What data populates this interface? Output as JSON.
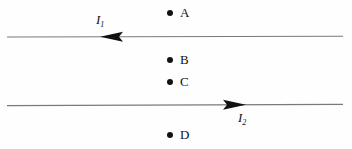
{
  "figure": {
    "background_color": "#fefefe",
    "ink_color": "#111111",
    "wire_color": "#7a7a7a"
  },
  "wires": [
    {
      "id": "wire-top",
      "current_label": "I",
      "current_subscript": "1",
      "direction": "left",
      "y": 37,
      "x_start": 7,
      "x_end": 343,
      "arrow_tip_x": 100
    },
    {
      "id": "wire-bottom",
      "current_label": "I",
      "current_subscript": "2",
      "direction": "right",
      "y": 105,
      "x_start": 7,
      "x_end": 343,
      "arrow_tip_x": 245
    }
  ],
  "points": [
    {
      "label": "A",
      "x": 170,
      "y": 13
    },
    {
      "label": "B",
      "x": 170,
      "y": 60
    },
    {
      "label": "C",
      "x": 170,
      "y": 82
    },
    {
      "label": "D",
      "x": 170,
      "y": 135
    }
  ]
}
